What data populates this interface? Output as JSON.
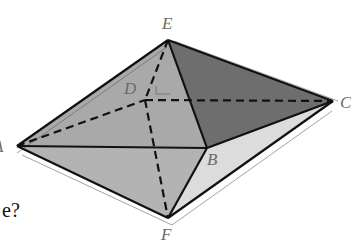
{
  "figure": {
    "vertices": {
      "E": {
        "label": "E",
        "x": 168,
        "y": 40
      },
      "A": {
        "label": "A",
        "x": 17,
        "y": 146
      },
      "B": {
        "label": "B",
        "x": 207,
        "y": 148
      },
      "C": {
        "label": "C",
        "x": 333,
        "y": 101
      },
      "D": {
        "label": "D",
        "x": 145,
        "y": 100
      },
      "F": {
        "label": "F",
        "x": 168,
        "y": 218
      }
    },
    "solid_edges": [
      "EA",
      "EB",
      "EC",
      "AB",
      "BC",
      "AF",
      "BF",
      "CF"
    ],
    "dashed_edges": [
      "ED",
      "AD",
      "DC",
      "DF"
    ],
    "colors": {
      "face_EAB": "#a9a9a9",
      "face_EBC": "#6e6e6e",
      "face_FAB": "#b3b3b3",
      "face_FBC": "#dcdcdc",
      "edge": "#111111",
      "label": "#6a6a6a"
    }
  },
  "labels": {
    "E": "E",
    "A": "A",
    "B": "B",
    "C": "C",
    "D": "D",
    "F": "F"
  },
  "text": {
    "partial_question": "e?"
  }
}
